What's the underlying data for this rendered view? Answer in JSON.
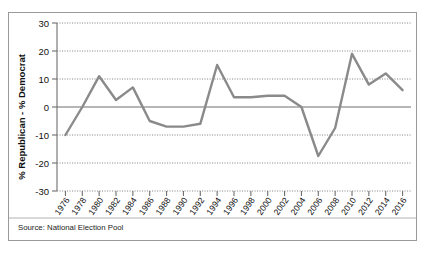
{
  "source_note": "Source: National Election Pool",
  "chart_data": {
    "type": "line",
    "title": "",
    "xlabel": "",
    "ylabel": "% Republican - % Democrat",
    "categories": [
      "1976",
      "1978",
      "1980",
      "1982",
      "1984",
      "1986",
      "1988",
      "1990",
      "1992",
      "1994",
      "1996",
      "1998",
      "2000",
      "2002",
      "2004",
      "2006",
      "2008",
      "2010",
      "2012",
      "2014",
      "2016"
    ],
    "values": [
      -10,
      0,
      11,
      2.5,
      7,
      -5,
      -7,
      -7,
      -6,
      15,
      3.5,
      3.5,
      4,
      4,
      0,
      -17.5,
      -7.5,
      19,
      8,
      12,
      6
    ],
    "series": [
      {
        "name": "% Republican - % Democrat",
        "values": [
          -10,
          0,
          11,
          2.5,
          7,
          -5,
          -7,
          -7,
          -6,
          15,
          3.5,
          3.5,
          4,
          4,
          0,
          -17.5,
          -7.5,
          19,
          8,
          12,
          6
        ]
      }
    ],
    "ylim": [
      -30,
      30
    ],
    "yticks": [
      30,
      20,
      10,
      0,
      -10,
      -20,
      -30
    ],
    "ytick_labels": [
      "30",
      "20",
      "10",
      "0",
      "-10",
      "-20",
      "-30"
    ],
    "grid": true,
    "legend": "none",
    "line_color": "#8a8a8a",
    "zero_line_color": "#6e6e6e",
    "grid_color": "#7d7d7d",
    "background_color": "#ffffff"
  }
}
